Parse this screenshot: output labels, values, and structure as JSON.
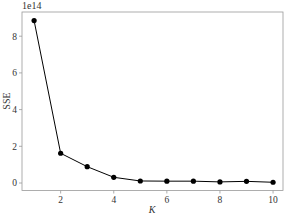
{
  "chart_data": {
    "type": "line",
    "title": "",
    "xlabel": "K",
    "ylabel": "SSE",
    "y_offset_text": "1e14",
    "x": [
      1,
      2,
      3,
      4,
      5,
      6,
      7,
      8,
      9,
      10
    ],
    "series": [
      {
        "name": "SSE",
        "values": [
          8.85,
          1.62,
          0.89,
          0.31,
          0.11,
          0.1,
          0.1,
          0.06,
          0.09,
          0.04
        ],
        "unit_multiplier": 100000000000000.0,
        "marker": "circle",
        "color": "#000000"
      }
    ],
    "xticks": [
      2,
      4,
      6,
      8,
      10
    ],
    "yticks": [
      0,
      2,
      4,
      6,
      8
    ],
    "xlim": [
      0.6,
      10.4
    ],
    "ylim": [
      -0.4,
      9.3
    ],
    "grid": false,
    "legend": null
  },
  "colors": {
    "line": "#000000",
    "frame": "#999999",
    "text": "#333333"
  }
}
